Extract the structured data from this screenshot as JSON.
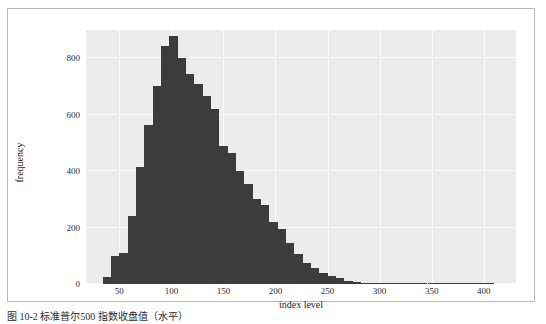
{
  "figure": {
    "caption": "图 10-2 标准普尔500 指数收盘值（水平）",
    "caption_number": ""
  },
  "chart_data": {
    "type": "bar",
    "subtype": "histogram",
    "title": "",
    "xlabel": "index level",
    "ylabel": "frequency",
    "xlim": [
      18,
      431
    ],
    "ylim": [
      0,
      900
    ],
    "xticks": [
      50,
      100,
      150,
      200,
      250,
      300,
      350,
      400
    ],
    "yticks": [
      0,
      200,
      400,
      600,
      800
    ],
    "grid": true,
    "legend": "none",
    "bar_color": "#3c3c3c",
    "plot_bgcolor": "#ececed",
    "gridline_color": "#fbfbfb",
    "bin_width": 8,
    "bin_starts": [
      34,
      42,
      50,
      58,
      66,
      74,
      82,
      90,
      98,
      106,
      114,
      122,
      130,
      138,
      146,
      154,
      162,
      170,
      178,
      186,
      194,
      202,
      210,
      218,
      226,
      234,
      242,
      250,
      258,
      266,
      274,
      282,
      290,
      298,
      306,
      314,
      322,
      330,
      338,
      346,
      354,
      362,
      370,
      378,
      386,
      394,
      402
    ],
    "values": [
      25,
      100,
      110,
      240,
      415,
      565,
      700,
      845,
      880,
      800,
      745,
      710,
      665,
      620,
      490,
      465,
      400,
      355,
      300,
      280,
      220,
      195,
      145,
      105,
      75,
      55,
      40,
      30,
      22,
      12,
      8,
      5,
      4,
      3,
      3,
      2,
      2,
      2,
      2,
      1,
      1,
      1,
      1,
      1,
      1,
      1,
      1
    ]
  }
}
